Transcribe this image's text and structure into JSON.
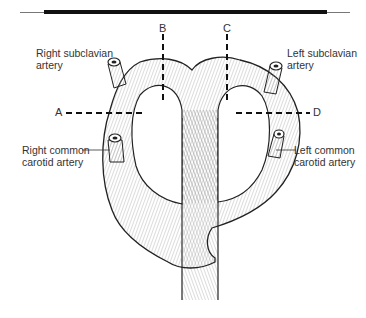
{
  "figure": {
    "labels": {
      "right_subclavian": "Right subclavian\nartery",
      "left_subclavian": "Left subclavian\nartery",
      "right_common_carotid": "Right common\ncarotid artery",
      "left_common_carotid": "Left common\ncarotid artery"
    },
    "section_markers": {
      "A": "A",
      "B": "B",
      "C": "C",
      "D": "D"
    }
  }
}
